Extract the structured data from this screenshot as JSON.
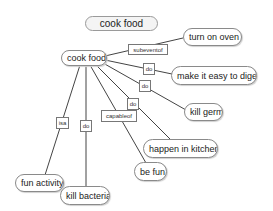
{
  "title": "cook food",
  "root": {
    "label": "cook food"
  },
  "nodes": [
    {
      "id": "turn-on-oven",
      "label": "turn on oven",
      "relation": "subeventof"
    },
    {
      "id": "make-it-easy-to-digest",
      "label": "make it easy to digest",
      "relation": "do"
    },
    {
      "id": "kill-germs",
      "label": "kill germs",
      "relation": "do"
    },
    {
      "id": "happen-in-kitchen",
      "label": "happen in kitchen",
      "relation": "do"
    },
    {
      "id": "be-fun",
      "label": "be fun",
      "relation": "capableof"
    },
    {
      "id": "fun-activity",
      "label": "fun activity",
      "relation": "isa"
    },
    {
      "id": "kill-bacteria",
      "label": "kill bacteria",
      "relation": "do"
    }
  ],
  "colors": {
    "edge": "#444444",
    "node_border": "#8a8a8a",
    "background": "#ffffff"
  }
}
